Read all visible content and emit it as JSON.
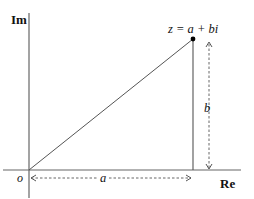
{
  "diagram": {
    "type": "complex-plane",
    "axes": {
      "imaginary_label": "Im",
      "real_label": "Re",
      "origin_label": "o"
    },
    "point": {
      "label": "z = a + bi",
      "real_part_label": "a",
      "imag_part_label": "b"
    },
    "colors": {
      "axis": "#555555",
      "line": "#444444",
      "dashed": "#555555",
      "point": "#000000",
      "text": "#111111"
    }
  }
}
